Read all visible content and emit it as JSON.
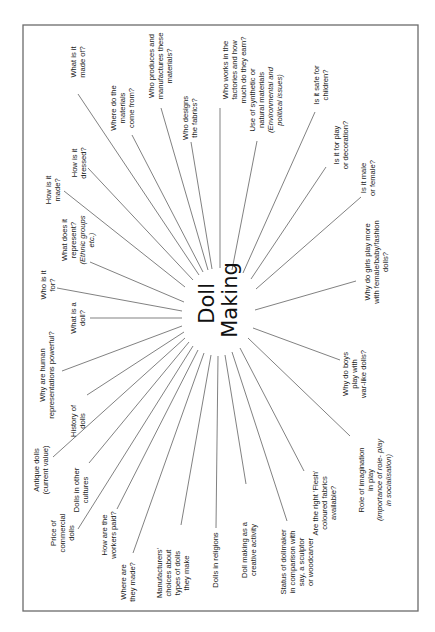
{
  "diagram": {
    "type": "spider-diagram",
    "orientation": "rotated-90-ccw",
    "center": {
      "x": 218,
      "y": 300,
      "lines": [
        "Doll",
        "Making"
      ]
    },
    "frame": {
      "x": 23,
      "y": 25,
      "width": 395,
      "height": 586
    },
    "nodes": [
      {
        "id": "how-made",
        "lines": [
          "How is it",
          "made?"
        ],
        "italic_from": -1,
        "tx": 52,
        "ty": 190,
        "x1": 64,
        "y1": 191,
        "x2": 185,
        "y2": 287
      },
      {
        "id": "how-dressed",
        "lines": [
          "How is it",
          "dressed?"
        ],
        "italic_from": -1,
        "tx": 78,
        "ty": 163,
        "x1": 88,
        "y1": 168,
        "x2": 193,
        "y2": 280
      },
      {
        "id": "what-made-of",
        "lines": [
          "What is it",
          "made of?"
        ],
        "italic_from": -1,
        "tx": 77,
        "ty": 62,
        "x1": 78,
        "y1": 94,
        "x2": 199,
        "y2": 275
      },
      {
        "id": "where-materials",
        "lines": [
          "Where do the",
          "materials",
          "come from?"
        ],
        "italic_from": -1,
        "tx": 122,
        "ty": 108,
        "x1": 132,
        "y1": 135,
        "x2": 203,
        "y2": 272
      },
      {
        "id": "who-produces",
        "lines": [
          "Who produces and",
          "manufactures these",
          "materials?"
        ],
        "italic_from": -1,
        "tx": 160,
        "ty": 66,
        "x1": 161,
        "y1": 108,
        "x2": 208,
        "y2": 270
      },
      {
        "id": "who-designs",
        "lines": [
          "Who designs",
          "the fabrics?"
        ],
        "italic_from": -1,
        "tx": 189,
        "ty": 118,
        "x1": 191,
        "y1": 142,
        "x2": 212,
        "y2": 269
      },
      {
        "id": "who-works",
        "lines": [
          "Who works in the",
          "factories and how",
          "much do they earn?"
        ],
        "italic_from": -1,
        "tx": 234,
        "ty": 70,
        "x1": 220,
        "y1": 108,
        "x2": 220,
        "y2": 268
      },
      {
        "id": "synthetic-natural",
        "lines": [
          "Use of synthetic or",
          "natural materials",
          "(Environmental and",
          "political issues)"
        ],
        "italic_from": 2,
        "tx": 265,
        "ty": 100,
        "x1": 257,
        "y1": 141,
        "x2": 232,
        "y2": 270
      },
      {
        "id": "safe-children",
        "lines": [
          "Is it safe for",
          "children?"
        ],
        "italic_from": -1,
        "tx": 320,
        "ty": 85,
        "x1": 315,
        "y1": 112,
        "x2": 243,
        "y2": 273
      },
      {
        "id": "play-decoration",
        "lines": [
          "Is it for play",
          "or decoration?"
        ],
        "italic_from": -1,
        "tx": 340,
        "ty": 145,
        "x1": 326,
        "y1": 167,
        "x2": 251,
        "y2": 279
      },
      {
        "id": "male-female",
        "lines": [
          "Is it male",
          "or female?"
        ],
        "italic_from": -1,
        "tx": 367,
        "ty": 178,
        "x1": 361,
        "y1": 197,
        "x2": 256,
        "y2": 289
      },
      {
        "id": "girls-fashion",
        "lines": [
          "Why do girls play more",
          "with female/baby/fashion",
          "dolls?"
        ],
        "italic_from": -1,
        "tx": 376,
        "ty": 262,
        "x1": 356,
        "y1": 281,
        "x2": 255,
        "y2": 310
      },
      {
        "id": "boys-war",
        "lines": [
          "Why do boys",
          "play with",
          "war-like dolls?"
        ],
        "italic_from": -1,
        "tx": 354,
        "ty": 374,
        "x1": 340,
        "y1": 360,
        "x2": 253,
        "y2": 328
      },
      {
        "id": "imagination",
        "lines": [
          "Role of imagination",
          "in play",
          "(importance of role- play",
          "in socialisation)"
        ],
        "italic_from": 2,
        "tx": 374,
        "ty": 480,
        "x1": 350,
        "y1": 436,
        "x2": 248,
        "y2": 338
      },
      {
        "id": "flesh-fabrics",
        "lines": [
          "Are the right 'Flesh'",
          "coloured fabrics",
          "available?"
        ],
        "italic_from": -1,
        "tx": 324,
        "ty": 503,
        "x1": 304,
        "y1": 471,
        "x2": 240,
        "y2": 348
      },
      {
        "id": "status",
        "lines": [
          "Status of dollmaker",
          "in comparison with",
          "say, a sculptor",
          "or woodcarver"
        ],
        "italic_from": -1,
        "tx": 296,
        "ty": 562,
        "x1": 287,
        "y1": 521,
        "x2": 232,
        "y2": 352
      },
      {
        "id": "creative",
        "lines": [
          "Doll making as a",
          "creative activity"
        ],
        "italic_from": -1,
        "tx": 248,
        "ty": 550,
        "x1": 246,
        "y1": 484,
        "x2": 225,
        "y2": 355
      },
      {
        "id": "religions",
        "lines": [
          "Dolls in religions"
        ],
        "italic_from": -1,
        "tx": 215,
        "ty": 560,
        "x1": 216,
        "y1": 528,
        "x2": 218,
        "y2": 356
      },
      {
        "id": "manufacturers",
        "lines": [
          "Manufacturers'",
          "choices about",
          "types of dolls",
          "they make"
        ],
        "italic_from": -1,
        "tx": 172,
        "ty": 573,
        "x1": 181,
        "y1": 525,
        "x2": 211,
        "y2": 355
      },
      {
        "id": "where-made",
        "lines": [
          "Where are",
          "they made?"
        ],
        "italic_from": -1,
        "tx": 127,
        "ty": 582,
        "x1": 133,
        "y1": 553,
        "x2": 204,
        "y2": 353
      },
      {
        "id": "workers-paid",
        "lines": [
          "How are the",
          "workers paid?"
        ],
        "italic_from": -1,
        "tx": 108,
        "ty": 535,
        "x1": 117,
        "y1": 509,
        "x2": 198,
        "y2": 350
      },
      {
        "id": "price",
        "lines": [
          "Price of",
          "commercial",
          "dolls"
        ],
        "italic_from": -1,
        "tx": 62,
        "ty": 533,
        "x1": 78,
        "y1": 529,
        "x2": 193,
        "y2": 346
      },
      {
        "id": "other-cultures",
        "lines": [
          "Dolls in other",
          "cultures"
        ],
        "italic_from": -1,
        "tx": 80,
        "ty": 490,
        "x1": 89,
        "y1": 463,
        "x2": 189,
        "y2": 342
      },
      {
        "id": "antique",
        "lines": [
          "Antique dolls",
          "(current value)"
        ],
        "italic_from": -1,
        "tx": 40,
        "ty": 470,
        "x1": 53,
        "y1": 457,
        "x2": 185,
        "y2": 338
      },
      {
        "id": "history",
        "lines": [
          "History of",
          "dolls"
        ],
        "italic_from": -1,
        "tx": 77,
        "ty": 421,
        "x1": 87,
        "y1": 395,
        "x2": 184,
        "y2": 332
      },
      {
        "id": "human-powerful",
        "lines": [
          "Why are human",
          "representations powerful?"
        ],
        "italic_from": -1,
        "tx": 46,
        "ty": 375,
        "x1": 62,
        "y1": 371,
        "x2": 182,
        "y2": 326
      },
      {
        "id": "what-doll",
        "lines": [
          "What is a",
          "doll?"
        ],
        "italic_from": -1,
        "tx": 77,
        "ty": 318,
        "x1": 90,
        "y1": 318,
        "x2": 182,
        "y2": 318
      },
      {
        "id": "who-for",
        "lines": [
          "Who is it",
          "for?"
        ],
        "italic_from": -1,
        "tx": 47,
        "ty": 285,
        "x1": 57,
        "y1": 288,
        "x2": 182,
        "y2": 311
      },
      {
        "id": "represent",
        "lines": [
          "What does it",
          "represent?",
          "(Ethnic groups",
          "etc.)"
        ],
        "italic_from": 2,
        "tx": 77,
        "ty": 240,
        "x1": 90,
        "y1": 262,
        "x2": 184,
        "y2": 302
      }
    ]
  }
}
